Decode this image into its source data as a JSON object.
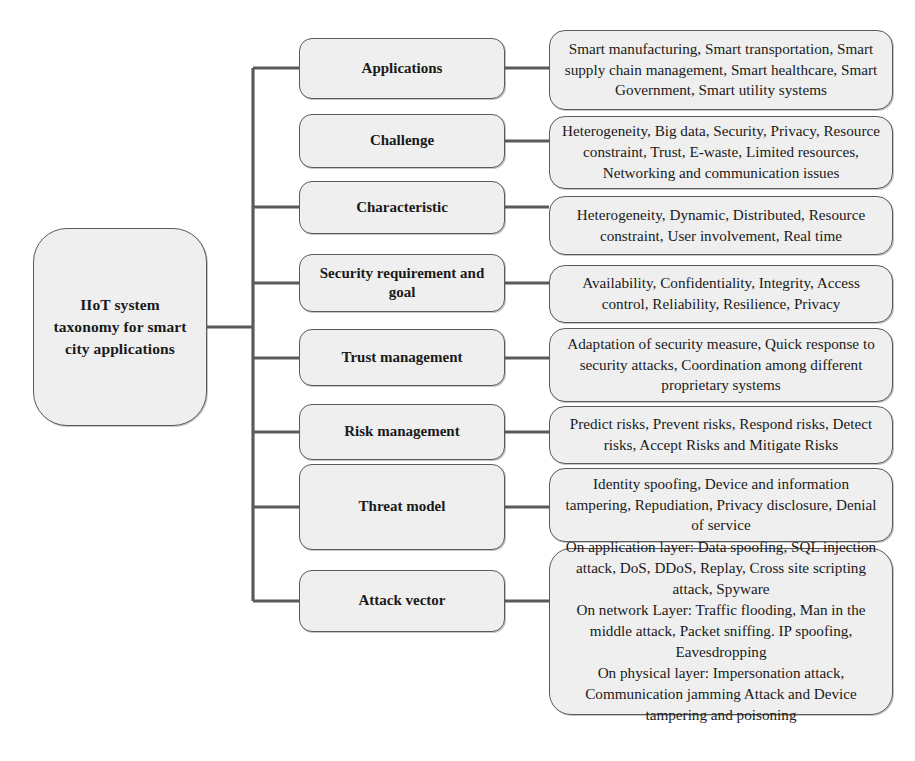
{
  "diagram": {
    "title": "IIoT system taxonomy for smart city applications",
    "root": {
      "id": "root",
      "label": "IIoT system\ntaxonomy for smart\ncity applications"
    },
    "branches": [
      {
        "id": "applications",
        "label": "Applications",
        "detail": "Smart manufacturing, Smart transportation, Smart supply chain management, Smart healthcare, Smart Government, Smart utility systems"
      },
      {
        "id": "challenge",
        "label": "Challenge",
        "detail": "Heterogeneity, Big data, Security, Privacy, Resource constraint, Trust, E-waste, Limited resources, Networking  and communication issues"
      },
      {
        "id": "characteristic",
        "label": "Characteristic",
        "detail": "Heterogeneity, Dynamic, Distributed, Resource constraint, User involvement, Real time"
      },
      {
        "id": "security-requirement-and-goal",
        "label": "Security requirement and goal",
        "detail": "Availability, Confidentiality, Integrity, Access control, Reliability, Resilience, Privacy"
      },
      {
        "id": "trust-management",
        "label": "Trust management",
        "detail": "Adaptation of security measure, Quick response to security attacks, Coordination among different proprietary systems"
      },
      {
        "id": "risk-management",
        "label": "Risk management",
        "detail": "Predict risks, Prevent risks, Respond risks, Detect risks, Accept Risks and Mitigate Risks"
      },
      {
        "id": "threat-model",
        "label": "Threat model",
        "detail": "Identity spoofing, Device and information tampering,  Repudiation, Privacy disclosure, Denial of service"
      },
      {
        "id": "attack-vector",
        "label": "Attack vector",
        "detail": "On application layer: Data spoofing, SQL injection attack, DoS, DDoS, Replay, Cross site scripting attack, Spyware\nOn network Layer: Traffic flooding, Man in the middle attack, Packet sniffing. IP spoofing, Eavesdropping\nOn physical  layer: Impersonation attack, Communication jamming Attack and Device tampering and poisoning"
      }
    ],
    "colors": {
      "node_fill": "#efefef",
      "node_border": "#5a5a5a",
      "connector": "#5a5a5a",
      "text": "#1a1a1a",
      "background": "#ffffff"
    }
  }
}
